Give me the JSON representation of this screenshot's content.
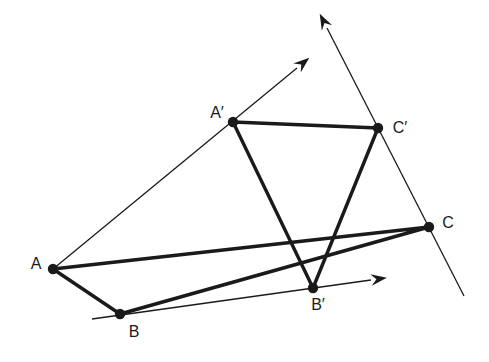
{
  "diagram": {
    "background_color": "#ffffff",
    "line_color": "#1a1a1a",
    "point_radius": 5.2,
    "thick_stroke": 3.4,
    "thin_stroke": 1.3,
    "points": [
      {
        "id": "A",
        "label": "A",
        "x": 53,
        "y": 269,
        "label_x": 36,
        "label_y": 269
      },
      {
        "id": "B",
        "label": "B",
        "x": 120,
        "y": 314,
        "label_x": 134,
        "label_y": 337
      },
      {
        "id": "C",
        "label": "C",
        "x": 429,
        "y": 227,
        "label_x": 448,
        "label_y": 228
      },
      {
        "id": "A2",
        "label": "A′",
        "x": 233,
        "y": 122,
        "label_x": 217,
        "label_y": 118
      },
      {
        "id": "B2",
        "label": "B′",
        "x": 313,
        "y": 288,
        "label_x": 318,
        "label_y": 310
      },
      {
        "id": "C2",
        "label": "C′",
        "x": 378,
        "y": 128,
        "label_x": 400,
        "label_y": 133
      }
    ],
    "triangles": [
      {
        "name": "triangle-ABC",
        "vertices": [
          "A",
          "B",
          "C"
        ]
      },
      {
        "name": "triangle-A2B2C2",
        "vertices": [
          "A2",
          "B2",
          "C2"
        ]
      }
    ],
    "rays": [
      {
        "name": "ray-through-A-Aprime",
        "x1": 53,
        "y1": 269,
        "x2": 297,
        "y2": 68,
        "arrow": true
      },
      {
        "name": "ray-through-B-Bprime",
        "x1": 92,
        "y1": 319,
        "x2": 371,
        "y2": 280,
        "arrow": true
      },
      {
        "name": "ray-through-C-Cprime",
        "x1": 464,
        "y1": 296,
        "x2": 327,
        "y2": 28,
        "arrow": true
      }
    ]
  }
}
